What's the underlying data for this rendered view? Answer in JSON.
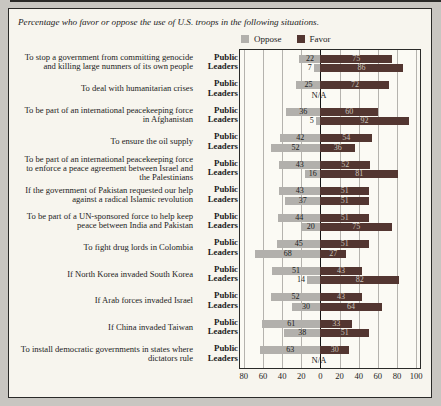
{
  "chart_data": {
    "type": "bar",
    "variant": "diverging-grouped-horizontal",
    "title": "Percentage who favor or oppose the use of U.S. troops in the following situations.",
    "legend_oppose": "Oppose",
    "legend_favor": "Favor",
    "legend_position": "top",
    "grid": true,
    "groups": [
      "Public",
      "Leaders"
    ],
    "na_label": "N/A",
    "axis_range": [
      -84,
      104
    ],
    "axis_ticks": [
      {
        "v": -80,
        "label": "80"
      },
      {
        "v": -60,
        "label": "60"
      },
      {
        "v": -40,
        "label": "40"
      },
      {
        "v": -20,
        "label": "20"
      },
      {
        "v": 0,
        "label": "0"
      },
      {
        "v": 20,
        "label": "20"
      },
      {
        "v": 40,
        "label": "40"
      },
      {
        "v": 60,
        "label": "60"
      },
      {
        "v": 80,
        "label": "80"
      },
      {
        "v": 100,
        "label": "100"
      }
    ],
    "colors": {
      "oppose": "#b2b0ac",
      "favor": "#533631",
      "oppose_text": "#1c1c1c",
      "favor_text": "#c9c3ba",
      "grid": "#b5b3ae",
      "zero": "#151515"
    },
    "categories": [
      {
        "label": "To stop a government from committing genocide and killing large numners of its own people",
        "public": {
          "oppose": 22,
          "favor": 75
        },
        "leaders": {
          "oppose": 7,
          "favor": 86
        }
      },
      {
        "label": "To deal with humanitarian crises",
        "public": {
          "oppose": 25,
          "favor": 72
        },
        "leaders": null
      },
      {
        "label": "To be part of an international peacekeeping force in Afghanistan",
        "public": {
          "oppose": 36,
          "favor": 60
        },
        "leaders": {
          "oppose": 5,
          "favor": 92
        }
      },
      {
        "label": "To ensure the oil supply",
        "public": {
          "oppose": 42,
          "favor": 54
        },
        "leaders": {
          "oppose": 52,
          "favor": 36
        }
      },
      {
        "label": "To be part of an international peacekeeping force to enforce a peace agreement between Israel and the Palestinians",
        "public": {
          "oppose": 43,
          "favor": 52
        },
        "leaders": {
          "oppose": 16,
          "favor": 81
        }
      },
      {
        "label": "If the government of Pakistan requested our help against a radical Islamic revolution",
        "public": {
          "oppose": 43,
          "favor": 51
        },
        "leaders": {
          "oppose": 37,
          "favor": 51
        }
      },
      {
        "label": "To be part of a UN-sponsored force to help keep peace between India and Pakistan",
        "public": {
          "oppose": 44,
          "favor": 51
        },
        "leaders": {
          "oppose": 20,
          "favor": 75
        }
      },
      {
        "label": "To fight drug lords in Colombia",
        "public": {
          "oppose": 45,
          "favor": 51
        },
        "leaders": {
          "oppose": 68,
          "favor": 27
        }
      },
      {
        "label": "If North Korea invaded South Korea",
        "public": {
          "oppose": 51,
          "favor": 43
        },
        "leaders": {
          "oppose": 14,
          "favor": 82
        }
      },
      {
        "label": "If Arab forces invaded Israel",
        "public": {
          "oppose": 52,
          "favor": 43
        },
        "leaders": {
          "oppose": 30,
          "favor": 64
        }
      },
      {
        "label": "If China invaded Taiwan",
        "public": {
          "oppose": 61,
          "favor": 33
        },
        "leaders": {
          "oppose": 38,
          "favor": 51
        }
      },
      {
        "label": "To install democratic governments in states where dictators rule",
        "public": {
          "oppose": 63,
          "favor": 30
        },
        "leaders": null
      }
    ]
  }
}
